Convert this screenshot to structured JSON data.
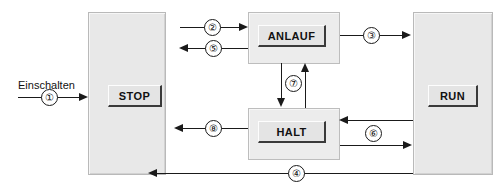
{
  "diagram": {
    "entry_label": "Einschalten",
    "states": {
      "stop": {
        "label": "STOP"
      },
      "run": {
        "label": "RUN"
      },
      "anlauf": {
        "label": "ANLAUF"
      },
      "halt": {
        "label": "HALT"
      }
    },
    "transitions": [
      {
        "id": "1",
        "number": "①",
        "from": "extern",
        "to": "STOP",
        "direction": "right"
      },
      {
        "id": "2",
        "number": "②",
        "from": "STOP",
        "to": "ANLAUF",
        "direction": "right"
      },
      {
        "id": "3",
        "number": "③",
        "from": "ANLAUF",
        "to": "RUN",
        "direction": "right"
      },
      {
        "id": "4",
        "number": "④",
        "from": "RUN",
        "to": "STOP",
        "direction": "left"
      },
      {
        "id": "5",
        "number": "⑤",
        "from": "ANLAUF",
        "to": "STOP",
        "direction": "left"
      },
      {
        "id": "6",
        "number": "⑥",
        "from": "RUN",
        "to": "HALT",
        "direction": "both"
      },
      {
        "id": "7",
        "number": "⑦",
        "from": "ANLAUF",
        "to": "HALT",
        "direction": "both"
      },
      {
        "id": "8",
        "number": "⑧",
        "from": "HALT",
        "to": "STOP",
        "direction": "left"
      }
    ],
    "colors": {
      "line": "#1a1a1a",
      "column_fill": "#e8e8e8",
      "box_fill": "#ececec",
      "button_fill": "#e4e4e4",
      "page_background": "#ffffff"
    }
  }
}
